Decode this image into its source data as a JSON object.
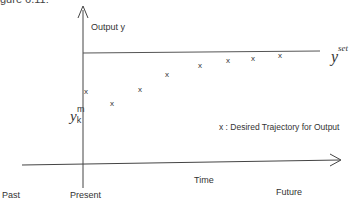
{
  "figure": {
    "caption_fragment": "gure 6.11:",
    "y_axis_label": "Output y",
    "setpoint_symbol": "y",
    "setpoint_superscript": "set",
    "current_output_symbol": "y",
    "current_output_subscript": "k",
    "current_output_superscript": "m",
    "legend_marker": "x",
    "legend_text": "x :  Desired Trajectory for Output",
    "x_axis_label": "Time",
    "time_labels": {
      "past": "Past",
      "present": "Present",
      "future": "Future"
    },
    "colors": {
      "line": "#444444",
      "text": "#333333",
      "background": "#ffffff"
    }
  },
  "trajectory_markers": [
    {
      "label": "x",
      "x": 88,
      "y": 92
    },
    {
      "label": "x",
      "x": 114,
      "y": 77
    },
    {
      "label": "x",
      "x": 142,
      "y": 63
    },
    {
      "label": "x",
      "x": 169,
      "y": 48
    },
    {
      "label": "x",
      "x": 201,
      "y": 38
    },
    {
      "label": "x",
      "x": 229,
      "y": 34
    },
    {
      "label": "x",
      "x": 254,
      "y": 31
    },
    {
      "label": "x",
      "x": 281,
      "y": 29
    }
  ]
}
